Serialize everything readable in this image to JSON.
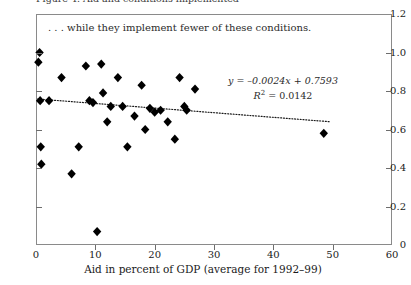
{
  "figure": {
    "top_clipped_caption": "Figure 4.  Aid and conditions implemented",
    "annotation": ". . . while they implement fewer of these conditions.",
    "equation_line1": "y = –0.0024x + 0.7593",
    "equation_r2_prefix": "R",
    "equation_r2_sup": "2",
    "equation_r2_value": " = 0.0142"
  },
  "chart_data": {
    "type": "scatter",
    "title": "",
    "subtitle": "",
    "xlabel": "Aid in percent of GDP (average for 1992–99)",
    "ylabel": "",
    "xlim": [
      0,
      60
    ],
    "ylim": [
      0,
      1.2
    ],
    "xticks": [
      0,
      10,
      20,
      30,
      40,
      50,
      60
    ],
    "xticklabels": [
      "0",
      "10",
      "20",
      "30",
      "40",
      "50",
      "60"
    ],
    "yticks": [
      0,
      0.2,
      0.4,
      0.6,
      0.8,
      1.0,
      1.2
    ],
    "yticklabels": [
      "0",
      "0.2",
      "0.4",
      "0.6",
      "0.8",
      "1.0",
      "1.2"
    ],
    "grid": false,
    "legend": null,
    "marker": "diamond",
    "marker_color": "#000000",
    "annotations": [
      {
        "text": ". . . while they implement fewer of these conditions.",
        "x": 2.0,
        "y": 1.14
      },
      {
        "text": "y = –0.0024x + 0.7593",
        "x": 36.0,
        "y": 0.885
      },
      {
        "text": "R² = 0.0142",
        "x": 36.0,
        "y": 0.82
      }
    ],
    "trendline": {
      "type": "linear",
      "slope": -0.0024,
      "intercept": 0.7593,
      "r_squared": 0.0142,
      "style": "dotted",
      "x_start": 0.3,
      "x_end": 49.5
    },
    "points": [
      {
        "x": 0.4,
        "y": 0.95
      },
      {
        "x": 0.6,
        "y": 1.0
      },
      {
        "x": 0.7,
        "y": 0.75
      },
      {
        "x": 0.8,
        "y": 0.51
      },
      {
        "x": 0.9,
        "y": 0.42
      },
      {
        "x": 2.2,
        "y": 0.75
      },
      {
        "x": 4.3,
        "y": 0.87
      },
      {
        "x": 6.0,
        "y": 0.37
      },
      {
        "x": 7.2,
        "y": 0.51
      },
      {
        "x": 8.4,
        "y": 0.93
      },
      {
        "x": 9.0,
        "y": 0.75
      },
      {
        "x": 9.6,
        "y": 0.74
      },
      {
        "x": 10.3,
        "y": 0.07
      },
      {
        "x": 11.0,
        "y": 0.94
      },
      {
        "x": 11.3,
        "y": 0.79
      },
      {
        "x": 12.0,
        "y": 0.64
      },
      {
        "x": 12.6,
        "y": 0.72
      },
      {
        "x": 13.8,
        "y": 0.87
      },
      {
        "x": 14.6,
        "y": 0.72
      },
      {
        "x": 15.4,
        "y": 0.51
      },
      {
        "x": 16.6,
        "y": 0.67
      },
      {
        "x": 17.8,
        "y": 0.83
      },
      {
        "x": 18.4,
        "y": 0.6
      },
      {
        "x": 19.2,
        "y": 0.71
      },
      {
        "x": 20.0,
        "y": 0.69
      },
      {
        "x": 21.0,
        "y": 0.7
      },
      {
        "x": 22.2,
        "y": 0.64
      },
      {
        "x": 23.4,
        "y": 0.55
      },
      {
        "x": 24.2,
        "y": 0.87
      },
      {
        "x": 25.0,
        "y": 0.72
      },
      {
        "x": 25.4,
        "y": 0.7
      },
      {
        "x": 26.8,
        "y": 0.81
      },
      {
        "x": 48.5,
        "y": 0.58
      }
    ]
  }
}
